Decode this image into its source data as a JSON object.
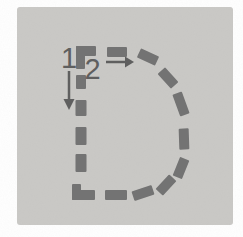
{
  "diagram": {
    "letter": "D",
    "colors": {
      "page_bg": "#ffffff",
      "card_bg": "#cac9c6",
      "dash": "#737373",
      "annotation": "#5f5f5f"
    },
    "card": {
      "x": 17,
      "y": 7,
      "width": 216,
      "height": 218,
      "radius": 3
    },
    "stroke_labels": [
      {
        "number": "1",
        "direction": "down",
        "x": 69,
        "y": 68
      },
      {
        "number": "2",
        "direction": "right",
        "x": 92.5,
        "y": 79
      }
    ],
    "arrows": [
      {
        "name": "stroke-1-down-arrow",
        "direction": "down",
        "line": {
          "x1": 69,
          "y1": 71,
          "x2": 69,
          "y2": 101
        },
        "head": [
          [
            63.5,
            99
          ],
          [
            74.5,
            99
          ],
          [
            69,
            110
          ]
        ]
      },
      {
        "name": "stroke-2-right-arrow",
        "direction": "right",
        "line": {
          "x1": 106,
          "y1": 62,
          "x2": 126,
          "y2": 62
        },
        "head": [
          [
            125,
            56.5
          ],
          [
            125,
            67.5
          ],
          [
            134,
            62
          ]
        ]
      }
    ],
    "dashes": [
      {
        "cx": 86,
        "cy": 51,
        "len": 20,
        "thk": 10,
        "rot": 0
      },
      {
        "cx": 80.5,
        "cy": 57.5,
        "len": 23,
        "thk": 9,
        "rot": 90
      },
      {
        "cx": 81,
        "cy": 82,
        "len": 14,
        "thk": 10,
        "rot": 90
      },
      {
        "cx": 81,
        "cy": 108,
        "len": 16,
        "thk": 11,
        "rot": 90
      },
      {
        "cx": 81,
        "cy": 136,
        "len": 18,
        "thk": 11,
        "rot": 90
      },
      {
        "cx": 81,
        "cy": 163,
        "len": 18,
        "thk": 11,
        "rot": 90
      },
      {
        "cx": 76.5,
        "cy": 192,
        "len": 16,
        "thk": 9,
        "rot": 90
      },
      {
        "cx": 83.5,
        "cy": 195,
        "len": 23,
        "thk": 10,
        "rot": 0
      },
      {
        "cx": 117,
        "cy": 52,
        "len": 20,
        "thk": 10,
        "rot": 0
      },
      {
        "cx": 148,
        "cy": 57,
        "len": 20,
        "thk": 10,
        "rot": 25
      },
      {
        "cx": 168,
        "cy": 78,
        "len": 20,
        "thk": 10,
        "rot": 48
      },
      {
        "cx": 181,
        "cy": 104,
        "len": 23,
        "thk": 10,
        "rot": 70
      },
      {
        "cx": 184,
        "cy": 139,
        "len": 21,
        "thk": 10,
        "rot": 88
      },
      {
        "cx": 181,
        "cy": 168,
        "len": 20,
        "thk": 10,
        "rot": 112
      },
      {
        "cx": 166,
        "cy": 185,
        "len": 20,
        "thk": 10,
        "rot": 133
      },
      {
        "cx": 143,
        "cy": 193,
        "len": 21,
        "thk": 10,
        "rot": 162
      },
      {
        "cx": 116,
        "cy": 195,
        "len": 22,
        "thk": 10,
        "rot": 0
      }
    ]
  }
}
